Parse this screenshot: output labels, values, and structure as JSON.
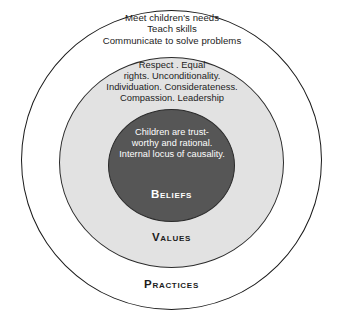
{
  "diagram": {
    "type": "concentric-circles",
    "title": "",
    "rings": [
      {
        "id": "practices",
        "label": "Practices",
        "fill": "#ffffff",
        "stroke": "#1a1a1a",
        "text_color": "#1c1c1c",
        "body": "Meet children's needs\nTeach skills\nCommunicate to solve problems"
      },
      {
        "id": "values",
        "label": "Values",
        "fill": "#e2e2e2",
        "stroke": "#2b2b2b",
        "text_color": "#1c1c1c",
        "body": "Respect . Equal\nrights. Unconditionality.\nIndividuation. Considerateness.\nCompassion. Leadership"
      },
      {
        "id": "beliefs",
        "label": "Beliefs",
        "fill": "#565656",
        "stroke": "#2b2b2b",
        "text_color": "#ffffff",
        "body": "Children are trust-\nworthy and rational.\nInternal locus of causality."
      }
    ]
  }
}
